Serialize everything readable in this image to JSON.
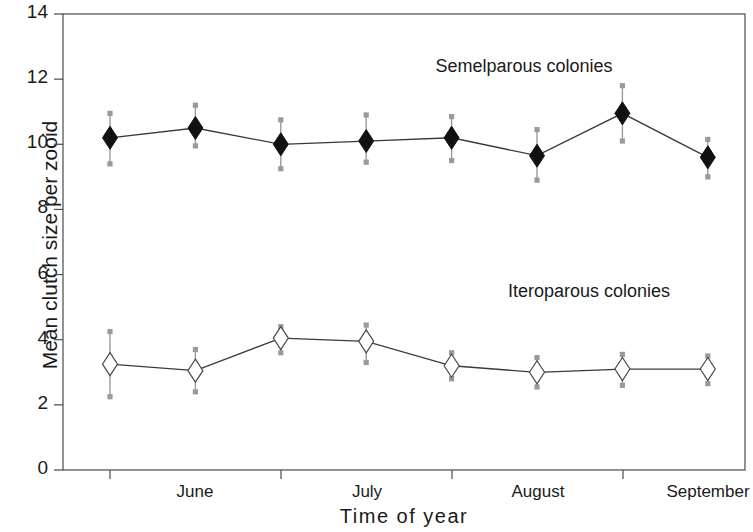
{
  "chart_data": {
    "type": "line",
    "title": "",
    "xlabel": "Time  of  year",
    "ylabel": "Mean clutch size per zooid",
    "ylim": [
      0,
      14
    ],
    "yticks": [
      0,
      2,
      4,
      6,
      8,
      10,
      12,
      14
    ],
    "ytick_labels": [
      "0",
      "2",
      "4",
      "6",
      "8",
      "10",
      "12",
      "14"
    ],
    "xtick_labels": [
      "June",
      "July",
      "August",
      "September"
    ],
    "xtick_positions": [
      195,
      367,
      538,
      708
    ],
    "xtick_marks": [
      110,
      281,
      452,
      623
    ],
    "grid": false,
    "legend_position": "inline-annotation",
    "x_indices": [
      1,
      2,
      3,
      4,
      5,
      6,
      7,
      8
    ],
    "series": [
      {
        "name": "Semelparous colonies",
        "marker": "filled-diamond",
        "color": "#111111",
        "values": [
          10.2,
          10.5,
          10.0,
          10.1,
          10.2,
          9.65,
          10.95,
          9.6
        ],
        "err_upper": [
          10.95,
          11.2,
          10.75,
          10.9,
          10.85,
          10.45,
          11.8,
          10.15
        ],
        "err_lower": [
          9.4,
          9.95,
          9.25,
          9.45,
          9.5,
          8.9,
          10.1,
          9.0
        ],
        "annotation": "Semelparous colonies",
        "annotation_x": 524,
        "annotation_y": 56
      },
      {
        "name": "Iteroparous colonies",
        "marker": "open-diamond",
        "color": "#111111",
        "values": [
          3.25,
          3.05,
          4.05,
          3.95,
          3.2,
          3.0,
          3.1,
          3.1
        ],
        "err_upper": [
          4.25,
          3.7,
          4.4,
          4.45,
          3.6,
          3.45,
          3.55,
          3.5
        ],
        "err_lower": [
          2.25,
          2.4,
          3.6,
          3.3,
          2.8,
          2.55,
          2.6,
          2.65
        ],
        "annotation": "Iteroparous colonies",
        "annotation_x": 589,
        "annotation_y": 281
      }
    ]
  },
  "axes": {
    "frame_color": "#4a4a4a",
    "errorbar_color": "#9a9a9a",
    "line_color": "#3a3a3a"
  }
}
